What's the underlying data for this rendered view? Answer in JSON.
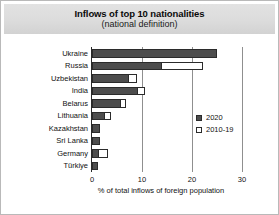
{
  "chart_data": {
    "type": "bar",
    "orientation": "horizontal",
    "stacked": true,
    "title": "Inflows of top 10 nationalities",
    "subtitle": "(national definition)",
    "xlabel": "% of total inflows of foreign population",
    "ylabel": "",
    "xlim": [
      0,
      30
    ],
    "xticks": [
      "0",
      "10",
      "20",
      "30"
    ],
    "xtick_values": [
      0,
      10,
      20,
      30
    ],
    "grid": "vertical",
    "legend_position": "inside-right",
    "categories": [
      "Ukraine",
      "Russia",
      "Uzbekistan",
      "India",
      "Belarus",
      "Lithuania",
      "Kazakhstan",
      "Sri Lanka",
      "Germany",
      "Türkiye"
    ],
    "series": [
      {
        "name": "2020",
        "color": "#4d4d4d",
        "values": [
          25.0,
          14.0,
          7.4,
          9.2,
          5.8,
          2.6,
          1.6,
          1.5,
          1.4,
          1.2
        ]
      },
      {
        "name": "2010-19",
        "color": "#ffffff",
        "values": [
          0.0,
          8.2,
          1.5,
          1.4,
          1.0,
          1.2,
          0.0,
          0.0,
          1.8,
          0.0
        ]
      }
    ]
  },
  "legend": {
    "items": [
      {
        "label": "2020",
        "style": "filled"
      },
      {
        "label": "2010-19",
        "style": "open"
      }
    ]
  }
}
